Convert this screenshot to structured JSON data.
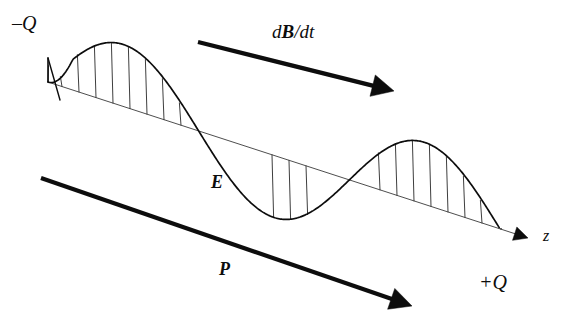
{
  "figure": {
    "kind": "physics-diagram",
    "title_visible": false,
    "background_color": "#ffffff",
    "stroke_color": "#0d0d0d",
    "thin_stroke_color": "#3a3a3a",
    "width": 566,
    "height": 325
  },
  "labels": {
    "charge_negative": "–Q",
    "charge_positive": "+Q",
    "field_electric": "E",
    "field_polarization": "P",
    "magnetic_rate": "dB/dt",
    "magnetic_rate_prefix": "d",
    "magnetic_rate_symbol": "B",
    "magnetic_rate_suffix": "/dt",
    "axis_z": "z"
  },
  "geometry": {
    "axis": {
      "name": "z-axis",
      "start": [
        48,
        82
      ],
      "end": [
        528,
        238
      ],
      "arrow_head_length": 14,
      "arrow_head_width": 7,
      "stroke_width": 0.9
    },
    "wave": {
      "name": "electric-field-wave",
      "description": "sine wave of one and a half periods drawn about the sloping z-axis",
      "start_x": 48,
      "end_x": 500,
      "amplitude_px": 62,
      "periods": 1.5,
      "phase_deg": 180,
      "stroke_width": 1.7,
      "taper_start": true
    },
    "hatch_lines": {
      "name": "field-vector-hatches",
      "count": 16,
      "stroke_width": 0.8,
      "x_positions": [
        62,
        79,
        96,
        113,
        130,
        147,
        164,
        181,
        198,
        272,
        289,
        306,
        380,
        397,
        414,
        431,
        448,
        465,
        482
      ]
    },
    "arrow_dbdt": {
      "name": "dB-dt-arrow",
      "start": [
        198,
        42
      ],
      "end": [
        394,
        91
      ],
      "stroke_width": 4.2,
      "arrow_head_length": 22,
      "arrow_head_width": 11
    },
    "arrow_p": {
      "name": "polarization-arrow",
      "start": [
        41,
        178
      ],
      "end": [
        412,
        306
      ],
      "stroke_width": 4.2,
      "arrow_head_length": 22,
      "arrow_head_width": 11
    }
  },
  "label_positions": {
    "charge_negative": {
      "left": 12,
      "top": 13
    },
    "charge_positive": {
      "left": 479,
      "top": 272
    },
    "field_electric": {
      "left": 211,
      "top": 173
    },
    "field_polarization": {
      "left": 219,
      "top": 260
    },
    "magnetic_rate": {
      "left": 272,
      "top": 22
    },
    "axis_z": {
      "left": 543,
      "top": 228
    }
  },
  "chart_data": {
    "type": "line",
    "title": "",
    "xlabel": "z",
    "ylabel": "E",
    "series": [
      {
        "name": "E",
        "form": "sine",
        "amplitude": 1.0,
        "periods": 1.5,
        "phase_deg": 180,
        "x_range": [
          0,
          1
        ]
      }
    ],
    "annotations": [
      "–Q",
      "+Q",
      "E",
      "P",
      "dB/dt",
      "z"
    ],
    "grid": false,
    "legend": "none"
  }
}
